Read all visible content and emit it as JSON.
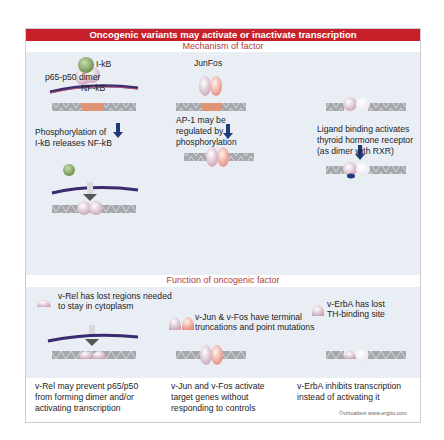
{
  "title": "Oncogenic variants may activate or inactivate transcription",
  "sections": {
    "mechanism": {
      "heading": "Mechanism of factor",
      "columns": [
        {
          "name": "NF-kB",
          "labels": {
            "ikb": "I-kB",
            "dimer": "p65-p50 dimer",
            "nfkb": "NF-kB",
            "caption_line1": "Phosphorylation of",
            "caption_line2": "I-kB releases NF-kB"
          }
        },
        {
          "name": "AP-1",
          "labels": {
            "junfos": "JunFos",
            "caption_line1": "AP-1 may be",
            "caption_line2": "regulated by",
            "caption_line3": "phosphorylation"
          }
        },
        {
          "name": "Thyroid hormone receptor",
          "labels": {
            "caption_line1": "Ligand binding activates",
            "caption_line2": "thyroid hormone receptor",
            "caption_line3": "(as dimer with RXR)"
          }
        }
      ]
    },
    "oncogenic": {
      "heading": "Function of oncogenic factor",
      "columns": [
        {
          "name": "v-Rel",
          "note_line1": "v-Rel has lost regions needed",
          "note_line2": "to stay in cytoplasm",
          "result_line1": "v-Rel may prevent p65/p50",
          "result_line2": "from forming dimer and/or",
          "result_line3": "activating transcription"
        },
        {
          "name": "v-Jun & v-Fos",
          "note_line1": "v-Jun & v-Fos have terminal",
          "note_line2": "truncations and point mutations",
          "result_line1": "v-Jun and v-Fos activate",
          "result_line2": "target genes without",
          "result_line3": "responding to controls"
        },
        {
          "name": "v-ErbA",
          "note_line1": "v-ErbA has lost",
          "note_line2": "TH-binding site",
          "result_line1": "v-ErbA inhibits transcription",
          "result_line2": "instead of activating it"
        }
      ]
    }
  },
  "credit": "©virtualtext  www.ergito.com",
  "colors": {
    "title_bar": "#c8202a",
    "heading_text": "#b23a3a",
    "panel_bg": "#e9edf4",
    "dna_gray": "#a6a7ad",
    "dna_site": "#e8906a",
    "arrow_blue": "#1f3a78",
    "membrane": "#3a2b6e",
    "ikb_green": "#7a9a5a"
  }
}
